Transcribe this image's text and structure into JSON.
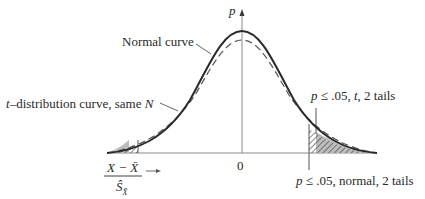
{
  "figure": {
    "axis": {
      "y_label": "p",
      "origin_label": "0",
      "x_label_numerator": "X − X̄",
      "x_label_denominator": "Ŝ",
      "x_label_denominator_sub": "X̄"
    },
    "labels": {
      "normal_curve": "Normal curve",
      "t_curve_prefix": "t",
      "t_curve_rest": "–distribution curve, same ",
      "t_curve_N": "N",
      "t_tails_p": "p",
      "t_tails_rest": " ≤ .05, ",
      "t_tails_t": "t",
      "t_tails_end": ", 2 tails",
      "normal_tails_p": "p",
      "normal_tails_rest": " ≤ .05, normal, 2 tails"
    },
    "colors": {
      "ink": "#2a2a2a",
      "axis": "#8a8a8a",
      "t_shade": "#bdbdbd",
      "background": "#ffffff"
    }
  }
}
